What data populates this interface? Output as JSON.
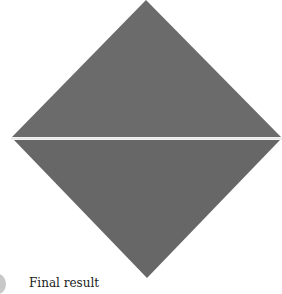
{
  "figure": {
    "caption": "Final result",
    "shape": "diamond",
    "fill_color": "#6b6b6b",
    "fold_line_color": "#e6e6e6",
    "background": "#ffffff"
  }
}
